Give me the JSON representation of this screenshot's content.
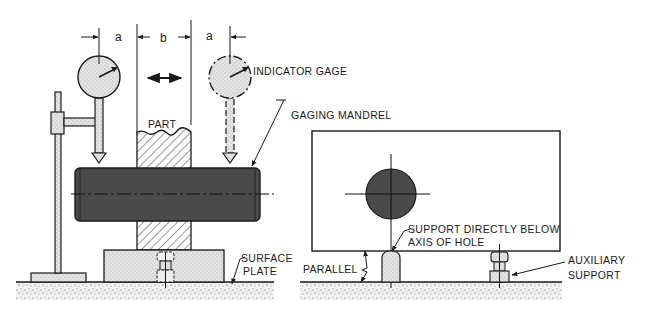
{
  "figure": {
    "left_view": {
      "dimensions": {
        "a_left": "a",
        "b": "b",
        "a_right": "a"
      },
      "labels": {
        "part": "PART",
        "indicator_gage": "INDICATOR GAGE",
        "gaging_mandrel": "GAGING MANDREL",
        "surface_plate_line1": "SURFACE",
        "surface_plate_line2": "PLATE"
      }
    },
    "right_view": {
      "labels": {
        "support_line1": "SUPPORT DIRECTLY BELOW",
        "support_line2": "AXIS OF HOLE",
        "parallel": "PARALLEL",
        "auxiliary_line1": "AUXILIARY",
        "auxiliary_line2": "SUPPORT"
      }
    },
    "colors": {
      "ink": "#1a1a1a",
      "mandrel": "#4a4a4a",
      "gage_fill": "#d9d9d9",
      "block_fill": "#e2e2e2",
      "surface_fill": "#f0f0f0"
    }
  }
}
